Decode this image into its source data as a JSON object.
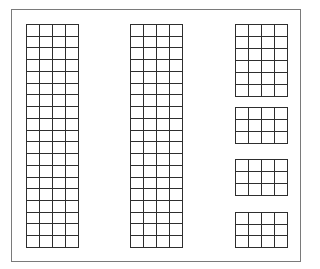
{
  "figure": {
    "frame": {
      "left": 11,
      "top": 9,
      "right": 300,
      "bottom": 261,
      "color": "#7a7a7a"
    },
    "line_color": "#2e2e2e",
    "grids": [
      {
        "id": "left-column-grid",
        "left": 26,
        "top": 24,
        "width": 52,
        "height": 223,
        "rows": 19,
        "cols": 4
      },
      {
        "id": "middle-column-grid",
        "left": 130,
        "top": 24,
        "width": 52,
        "height": 223,
        "rows": 19,
        "cols": 4
      },
      {
        "id": "right-grid-1",
        "left": 235,
        "top": 24,
        "width": 52,
        "height": 72,
        "rows": 6,
        "cols": 4
      },
      {
        "id": "right-grid-2",
        "left": 235,
        "top": 107,
        "width": 52,
        "height": 36,
        "rows": 3,
        "cols": 4
      },
      {
        "id": "right-grid-3",
        "left": 235,
        "top": 159,
        "width": 52,
        "height": 36,
        "rows": 3,
        "cols": 4
      },
      {
        "id": "right-grid-4",
        "left": 235,
        "top": 212,
        "width": 52,
        "height": 35,
        "rows": 3,
        "cols": 4
      }
    ]
  }
}
